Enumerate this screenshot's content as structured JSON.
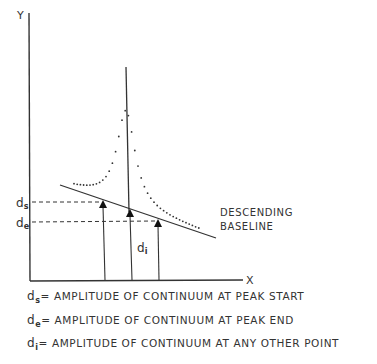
{
  "axes": {
    "y_label": "Y",
    "x_label": "X"
  },
  "markers": {
    "ds": {
      "sym": "d",
      "sub": "s"
    },
    "de": {
      "sym": "d",
      "sub": "e"
    },
    "di": {
      "sym": "d",
      "sub": "i"
    }
  },
  "baseline_label": {
    "line1": "DESCENDING",
    "line2": "BASELINE"
  },
  "definitions": [
    {
      "sym": "d",
      "sub": "s",
      "text": "= AMPLITUDE OF CONTINUUM AT PEAK START"
    },
    {
      "sym": "d",
      "sub": "e",
      "text": "= AMPLITUDE OF CONTINUUM AT PEAK END"
    },
    {
      "sym": "d",
      "sub": "i",
      "text": "= AMPLITUDE OF CONTINUUM AT ANY OTHER POINT"
    }
  ]
}
